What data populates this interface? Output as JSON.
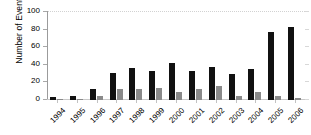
{
  "chart_data": {
    "type": "bar",
    "title": "",
    "xlabel": "",
    "ylabel": "Number of Events",
    "ylim": [
      0,
      100
    ],
    "yticks": [
      0,
      20,
      40,
      60,
      80,
      100
    ],
    "grid": "horizontal-dotted-top-only",
    "legend": "none",
    "categories": [
      "1994",
      "1995",
      "1996",
      "1997",
      "1998",
      "1999",
      "2000",
      "2001",
      "2002",
      "2003",
      "2004",
      "2005",
      "2006"
    ],
    "series": [
      {
        "name": "series-1",
        "color": "#111111",
        "values": [
          3,
          4,
          13,
          31,
          36,
          33,
          42,
          33,
          38,
          29,
          35,
          77,
          83
        ]
      },
      {
        "name": "series-2",
        "color": "#8a8a8a",
        "values": [
          1,
          1,
          5,
          13,
          12,
          14,
          9,
          13,
          16,
          5,
          9,
          4,
          2
        ]
      }
    ]
  },
  "axes": {
    "y_title": "Number of Events",
    "y_tick_labels": [
      "0",
      "20",
      "40",
      "60",
      "80",
      "100"
    ],
    "x_tick_labels": [
      "1994",
      "1995",
      "1996",
      "1997",
      "1998",
      "1999",
      "2000",
      "2001",
      "2002",
      "2003",
      "2004",
      "2005",
      "2006"
    ]
  },
  "colors": {
    "series_primary": "#111111",
    "series_secondary": "#8a8a8a",
    "axis": "#9b9b9b",
    "gridline": "#d2d2d2",
    "background": "#ffffff",
    "text": "#000000"
  }
}
